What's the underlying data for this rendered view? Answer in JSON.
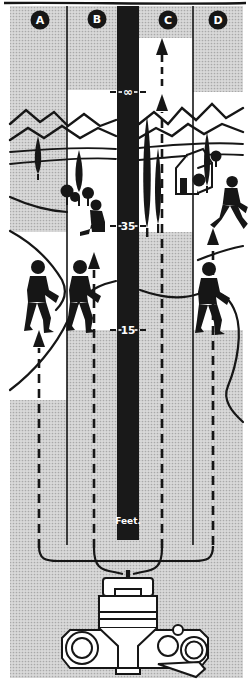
{
  "columns": [
    {
      "id": "A",
      "label": "A"
    },
    {
      "id": "B",
      "label": "B"
    },
    {
      "id": "C",
      "label": "C"
    },
    {
      "id": "D",
      "label": "D"
    }
  ],
  "distance_scale": {
    "unit_label": "Feet.",
    "ticks": [
      {
        "label": "∞"
      },
      {
        "label": "35"
      },
      {
        "label": "15"
      }
    ]
  },
  "colors": {
    "ink": "#161616",
    "paper": "#ffffff",
    "halftone_base": "#d9d9d9",
    "halftone_dot": "#a9a9a9",
    "distance_bar": "#191919"
  },
  "icons": {
    "camera-icon": "slr-camera-top-view",
    "figure_icons": [
      "standing-person-icon",
      "walking-person-icon",
      "sitting-person-icon"
    ],
    "scenery_icons": [
      "mountain-icon",
      "cypress-tree-icon",
      "round-tree-icon",
      "house-icon",
      "road-icon"
    ],
    "arrow_icon": "dashed-focus-arrow"
  }
}
